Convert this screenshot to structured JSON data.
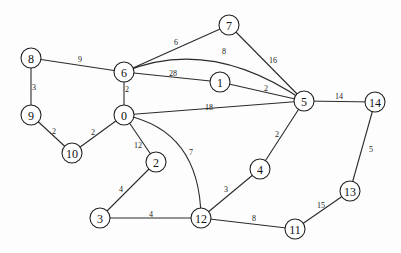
{
  "diagram": {
    "type": "weighted-undirected-graph",
    "colors": {
      "edge": "#2a2a2a",
      "node_stroke": "#222222",
      "node_fill": "#ffffff",
      "text": "#111111",
      "background": "#fdfdfd"
    },
    "node_radius": 10,
    "nodes": [
      {
        "id": "0",
        "label": "0",
        "x": 124,
        "y": 115
      },
      {
        "id": "1",
        "label": "1",
        "x": 220,
        "y": 82
      },
      {
        "id": "2",
        "label": "2",
        "x": 156,
        "y": 162
      },
      {
        "id": "3",
        "label": "3",
        "x": 100,
        "y": 218
      },
      {
        "id": "4",
        "label": "4",
        "x": 260,
        "y": 169
      },
      {
        "id": "5",
        "label": "5",
        "x": 304,
        "y": 101
      },
      {
        "id": "6",
        "label": "6",
        "x": 124,
        "y": 72
      },
      {
        "id": "7",
        "label": "7",
        "x": 229,
        "y": 25
      },
      {
        "id": "8",
        "label": "8",
        "x": 31,
        "y": 58
      },
      {
        "id": "9",
        "label": "9",
        "x": 31,
        "y": 115
      },
      {
        "id": "10",
        "label": "10",
        "x": 72,
        "y": 153
      },
      {
        "id": "11",
        "label": "11",
        "x": 295,
        "y": 229
      },
      {
        "id": "12",
        "label": "12",
        "x": 201,
        "y": 218
      },
      {
        "id": "13",
        "label": "13",
        "x": 350,
        "y": 191
      },
      {
        "id": "14",
        "label": "14",
        "x": 375,
        "y": 102
      }
    ],
    "edges": [
      {
        "from": "8",
        "to": "6",
        "weight": "9",
        "lx": 80,
        "ly": 59
      },
      {
        "from": "8",
        "to": "9",
        "weight": "3",
        "lx": 34,
        "ly": 87
      },
      {
        "from": "6",
        "to": "7",
        "weight": "6",
        "lx": 176,
        "ly": 42
      },
      {
        "from": "6",
        "to": "5",
        "weight": "8",
        "lx": 224,
        "ly": 51,
        "curve": {
          "cx": 210,
          "cy": 36
        }
      },
      {
        "from": "6",
        "to": "1",
        "weight": "28",
        "lx": 173,
        "ly": 73
      },
      {
        "from": "6",
        "to": "0",
        "weight": "2",
        "lx": 127,
        "ly": 89
      },
      {
        "from": "7",
        "to": "5",
        "weight": "16",
        "lx": 273,
        "ly": 60
      },
      {
        "from": "1",
        "to": "5",
        "weight": "2",
        "lx": 266,
        "ly": 88
      },
      {
        "from": "0",
        "to": "5",
        "weight": "18",
        "lx": 209,
        "ly": 107
      },
      {
        "from": "5",
        "to": "14",
        "weight": "14",
        "lx": 339,
        "ly": 96
      },
      {
        "from": "5",
        "to": "4",
        "weight": "2",
        "lx": 277,
        "ly": 134
      },
      {
        "from": "14",
        "to": "13",
        "weight": "5",
        "lx": 371,
        "ly": 149
      },
      {
        "from": "13",
        "to": "11",
        "weight": "15",
        "lx": 321,
        "ly": 205
      },
      {
        "from": "12",
        "to": "11",
        "weight": "8",
        "lx": 254,
        "ly": 218
      },
      {
        "from": "4",
        "to": "12",
        "weight": "3",
        "lx": 226,
        "ly": 189
      },
      {
        "from": "0",
        "to": "12",
        "weight": "7",
        "lx": 191,
        "ly": 152,
        "curve": {
          "cx": 200,
          "cy": 130
        }
      },
      {
        "from": "0",
        "to": "2",
        "weight": "12",
        "lx": 138,
        "ly": 145
      },
      {
        "from": "2",
        "to": "3",
        "weight": "4",
        "lx": 121,
        "ly": 189
      },
      {
        "from": "3",
        "to": "12",
        "weight": "4",
        "lx": 151,
        "ly": 214
      },
      {
        "from": "0",
        "to": "10",
        "weight": "2",
        "lx": 93,
        "ly": 132
      },
      {
        "from": "9",
        "to": "10",
        "weight": "2",
        "lx": 54,
        "ly": 131
      }
    ]
  }
}
